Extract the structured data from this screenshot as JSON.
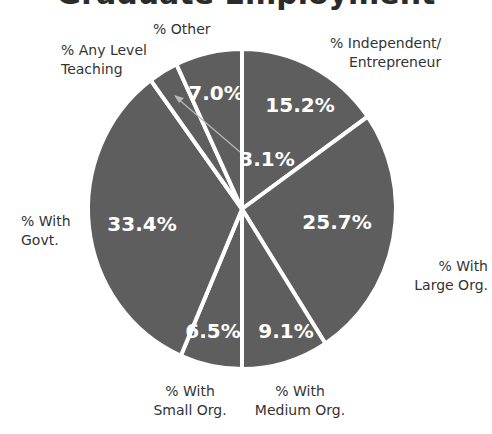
{
  "chart_data": {
    "type": "pie",
    "title": "Graduate Employment",
    "title_visible": "partially cropped at top",
    "start_angle_deg": 0,
    "direction": "clockwise",
    "slices": [
      {
        "label": "% Independent/ Entrepreneur",
        "label_lines": [
          "% Independent/",
          "Entrepreneur"
        ],
        "value": 15.2,
        "display": "15.2%"
      },
      {
        "label": "% With Large Org.",
        "label_lines": [
          "% With",
          "Large Org."
        ],
        "value": 25.7,
        "display": "25.7%"
      },
      {
        "label": "% With Medium Org.",
        "label_lines": [
          "% With",
          "Medium Org."
        ],
        "value": 9.1,
        "display": "9.1%"
      },
      {
        "label": "% With Small Org.",
        "label_lines": [
          "% With",
          "Small Org."
        ],
        "value": 6.5,
        "display": "6.5%"
      },
      {
        "label": "% With Govt.",
        "label_lines": [
          "% With",
          "Govt."
        ],
        "value": 33.4,
        "display": "33.4%"
      },
      {
        "label": "% Any Level Teaching",
        "label_lines": [
          "% Any Level",
          "Teaching"
        ],
        "value": 3.1,
        "display": "3.1%",
        "annotation": "value label placed outside slice with leader arrow"
      },
      {
        "label": "% Other",
        "label_lines": [
          "% Other"
        ],
        "value": 7.0,
        "display": "7.0%"
      }
    ],
    "colors": {
      "slice_fill": "#5e5e5e",
      "slice_border": "#ffffff",
      "value_text": "#ffffff",
      "category_text": "#333333",
      "arrow": "#b8b8b8"
    },
    "legend": "none (labels placed around pie)"
  }
}
